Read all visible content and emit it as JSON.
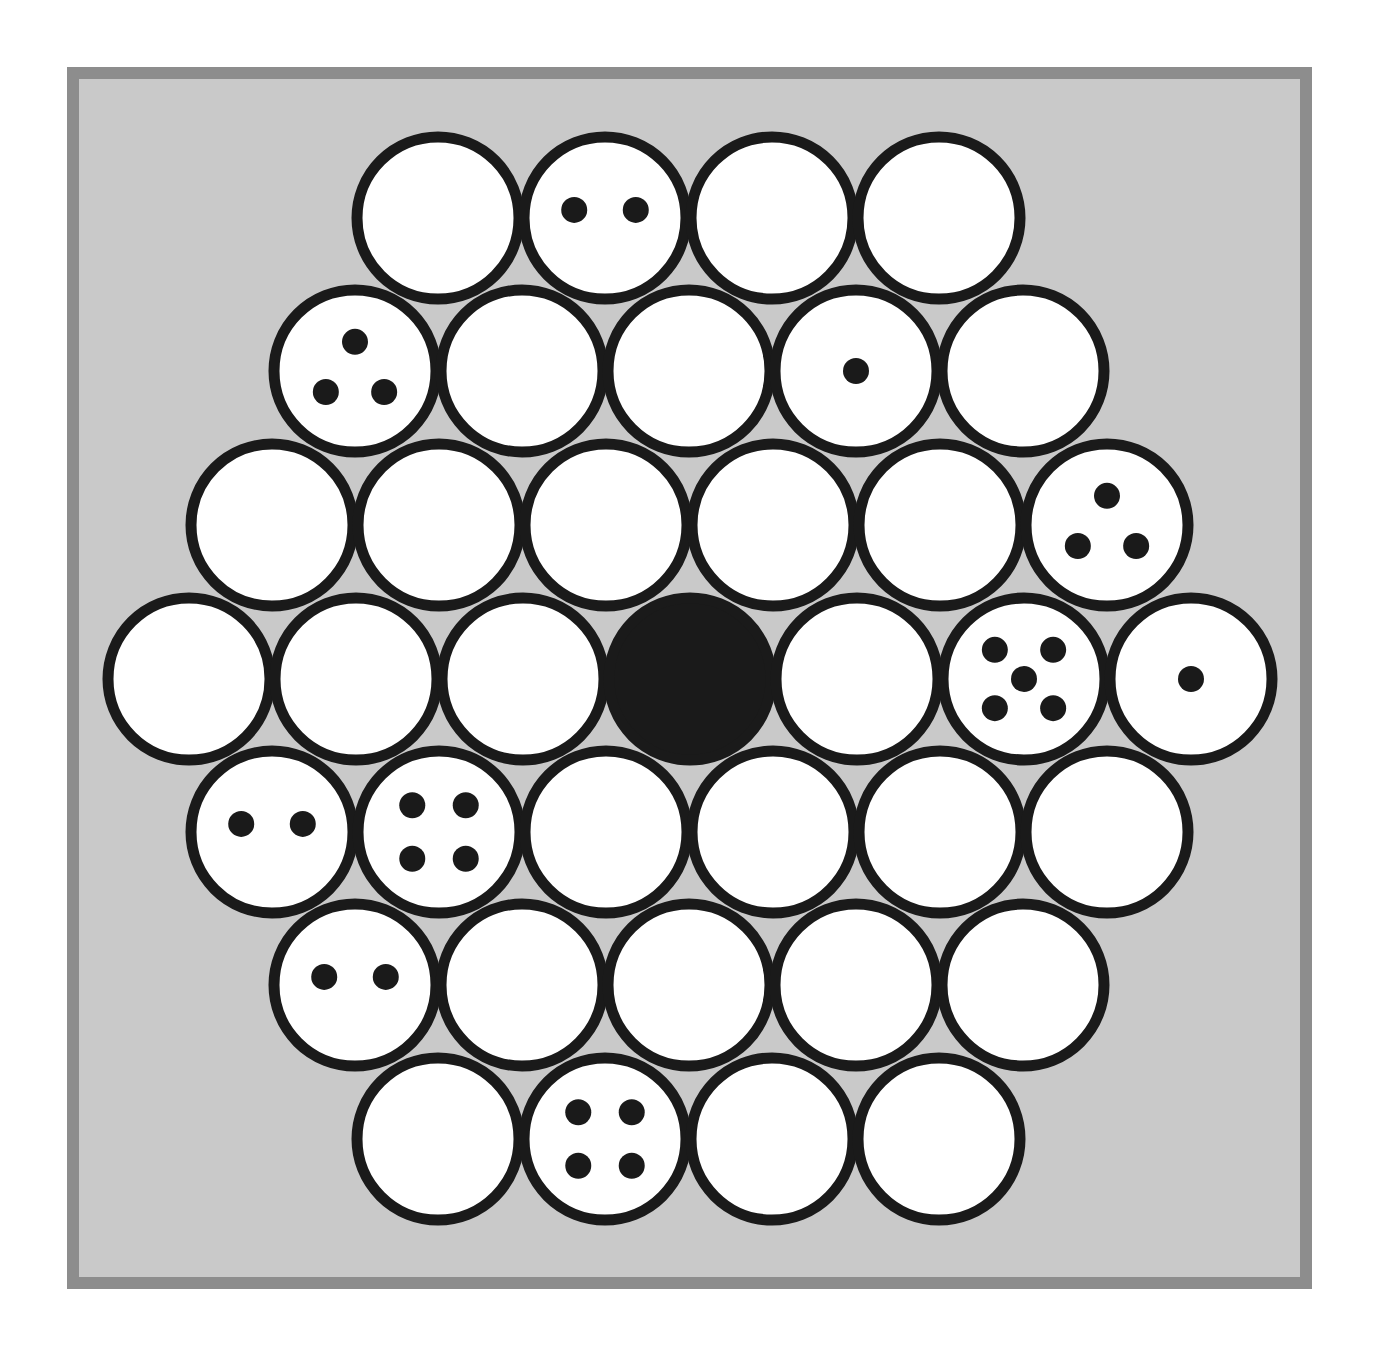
{
  "canvas": {
    "width": 1376,
    "height": 1357,
    "background": "#ffffff"
  },
  "frame": {
    "x": 67,
    "y": 67,
    "width": 1245,
    "height": 1222,
    "border_color": "#8d8d8d",
    "border_width": 12,
    "fill_color": "#c9c9c9"
  },
  "style": {
    "circle_stroke": "#1a1a1a",
    "circle_fill": "#ffffff",
    "circle_filled": "#1a1a1a",
    "dot_color": "#1a1a1a",
    "stroke_width": 11,
    "radius": 81,
    "dot_radius": 13
  },
  "board": {
    "name": "hexagonal-circle-packing",
    "shape": "hexagon",
    "total_circles": 37,
    "row_pitch_y": 152,
    "column_pitch_x": 167,
    "rows": [
      {
        "index": 0,
        "cy": 218,
        "x_start": 438,
        "count": 4,
        "cells": [
          {
            "col": 0,
            "cx": 438,
            "dots": 0,
            "filled": false
          },
          {
            "col": 1,
            "cx": 605,
            "dots": 2,
            "filled": false
          },
          {
            "col": 2,
            "cx": 772,
            "dots": 0,
            "filled": false
          },
          {
            "col": 3,
            "cx": 939,
            "dots": 0,
            "filled": false
          }
        ]
      },
      {
        "index": 1,
        "cy": 371,
        "x_start": 355,
        "count": 5,
        "cells": [
          {
            "col": 0,
            "cx": 355,
            "dots": 3,
            "filled": false
          },
          {
            "col": 1,
            "cx": 522,
            "dots": 0,
            "filled": false
          },
          {
            "col": 2,
            "cx": 689,
            "dots": 0,
            "filled": false
          },
          {
            "col": 3,
            "cx": 856,
            "dots": 1,
            "filled": false
          },
          {
            "col": 4,
            "cx": 1023,
            "dots": 0,
            "filled": false
          }
        ]
      },
      {
        "index": 2,
        "cy": 525,
        "x_start": 272,
        "count": 6,
        "cells": [
          {
            "col": 0,
            "cx": 272,
            "dots": 0,
            "filled": false
          },
          {
            "col": 1,
            "cx": 439,
            "dots": 0,
            "filled": false
          },
          {
            "col": 2,
            "cx": 606,
            "dots": 0,
            "filled": false
          },
          {
            "col": 3,
            "cx": 773,
            "dots": 0,
            "filled": false
          },
          {
            "col": 4,
            "cx": 940,
            "dots": 0,
            "filled": false
          },
          {
            "col": 5,
            "cx": 1107,
            "dots": 3,
            "filled": false
          }
        ]
      },
      {
        "index": 3,
        "cy": 679,
        "x_start": 189,
        "count": 7,
        "cells": [
          {
            "col": 0,
            "cx": 189,
            "dots": 0,
            "filled": false
          },
          {
            "col": 1,
            "cx": 356,
            "dots": 0,
            "filled": false
          },
          {
            "col": 2,
            "cx": 523,
            "dots": 0,
            "filled": false
          },
          {
            "col": 3,
            "cx": 690,
            "dots": 0,
            "filled": true
          },
          {
            "col": 4,
            "cx": 857,
            "dots": 0,
            "filled": false
          },
          {
            "col": 5,
            "cx": 1024,
            "dots": 5,
            "filled": false
          },
          {
            "col": 6,
            "cx": 1191,
            "dots": 1,
            "filled": false
          }
        ]
      },
      {
        "index": 4,
        "cy": 832,
        "x_start": 272,
        "count": 6,
        "cells": [
          {
            "col": 0,
            "cx": 272,
            "dots": 2,
            "filled": false
          },
          {
            "col": 1,
            "cx": 439,
            "dots": 4,
            "filled": false
          },
          {
            "col": 2,
            "cx": 606,
            "dots": 0,
            "filled": false
          },
          {
            "col": 3,
            "cx": 773,
            "dots": 0,
            "filled": false
          },
          {
            "col": 4,
            "cx": 940,
            "dots": 0,
            "filled": false
          },
          {
            "col": 5,
            "cx": 1107,
            "dots": 0,
            "filled": false
          }
        ]
      },
      {
        "index": 5,
        "cy": 985,
        "x_start": 355,
        "count": 5,
        "cells": [
          {
            "col": 0,
            "cx": 355,
            "dots": 2,
            "filled": false
          },
          {
            "col": 1,
            "cx": 522,
            "dots": 0,
            "filled": false
          },
          {
            "col": 2,
            "cx": 689,
            "dots": 0,
            "filled": false
          },
          {
            "col": 3,
            "cx": 856,
            "dots": 0,
            "filled": false
          },
          {
            "col": 4,
            "cx": 1023,
            "dots": 0,
            "filled": false
          }
        ]
      },
      {
        "index": 6,
        "cy": 1139,
        "x_start": 438,
        "count": 4,
        "cells": [
          {
            "col": 0,
            "cx": 438,
            "dots": 0,
            "filled": false
          },
          {
            "col": 1,
            "cx": 605,
            "dots": 4,
            "filled": false
          },
          {
            "col": 2,
            "cx": 772,
            "dots": 0,
            "filled": false
          },
          {
            "col": 3,
            "cx": 939,
            "dots": 0,
            "filled": false
          }
        ]
      }
    ]
  },
  "dot_layouts": {
    "1": [
      [
        0,
        0
      ]
    ],
    "2": [
      [
        -0.38,
        -0.1
      ],
      [
        0.38,
        -0.1
      ]
    ],
    "3": [
      [
        0,
        -0.36
      ],
      [
        -0.36,
        0.26
      ],
      [
        0.36,
        0.26
      ]
    ],
    "4": [
      [
        -0.33,
        -0.33
      ],
      [
        0.33,
        -0.33
      ],
      [
        -0.33,
        0.33
      ],
      [
        0.33,
        0.33
      ]
    ],
    "5": [
      [
        -0.36,
        -0.36
      ],
      [
        0.36,
        -0.36
      ],
      [
        0,
        0
      ],
      [
        -0.36,
        0.36
      ],
      [
        0.36,
        0.36
      ]
    ]
  }
}
